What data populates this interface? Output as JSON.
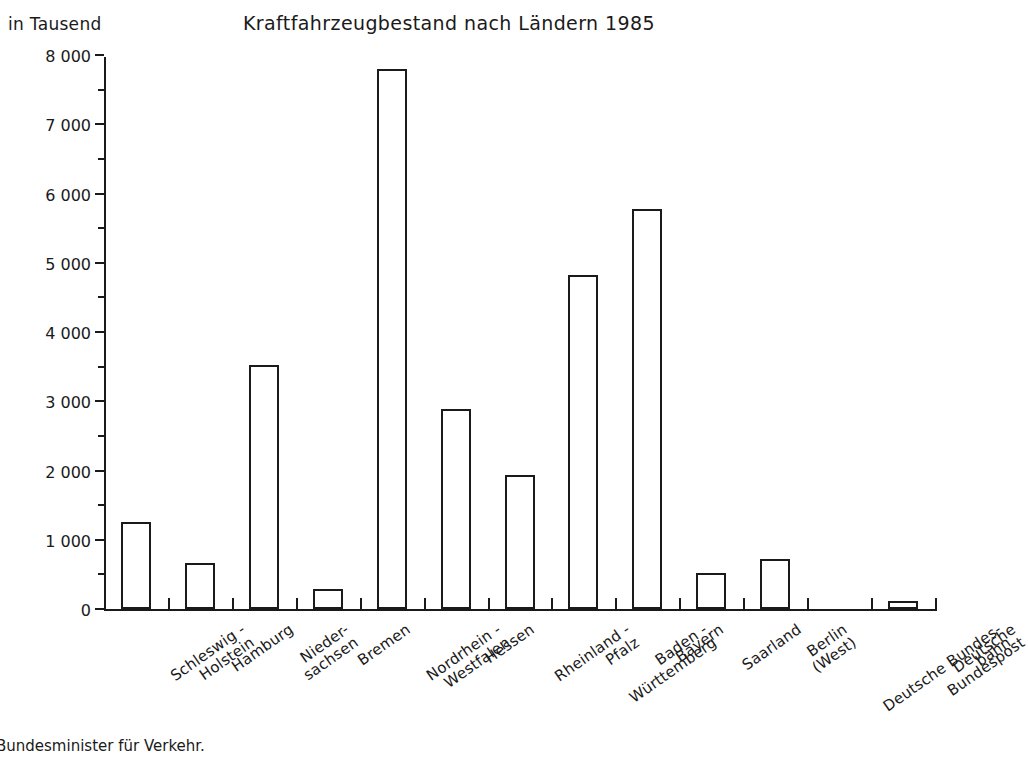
{
  "header": {
    "unit_label": "in Tausend",
    "title": "Kraftfahrzeugbestand nach Ländern 1985"
  },
  "footer": {
    "source_note": "Bundesminister für Verkehr."
  },
  "chart_data": {
    "type": "bar",
    "title": "Kraftfahrzeugbestand nach Ländern 1985",
    "xlabel": "",
    "ylabel": "in Tausend",
    "ylim": [
      0,
      8000
    ],
    "ytick_step": 1000,
    "yminor_step": 500,
    "grid": false,
    "legend": null,
    "bar_style": "outline",
    "categories": [
      "Schleswig -\nHolstein",
      "Hamburg",
      "Nieder-\nsachsen",
      "Bremen",
      "Nordrhein -\nWestfalen",
      "Hessen",
      "Rheinland -\nPfalz",
      "Baden -\nWürttemberg",
      "Bayern",
      "Saarland",
      "Berlin\n(West)",
      "Deutsche Bundes-\nbahn",
      "Deutsche\nBundespost"
    ],
    "values": [
      1250,
      660,
      3520,
      290,
      7800,
      2890,
      1930,
      4820,
      5780,
      520,
      720,
      0,
      110
    ],
    "ytick_labels": [
      "0",
      "1 000",
      "2 000",
      "3 000",
      "4 000",
      "5 000",
      "6 000",
      "7 000",
      "8 000"
    ],
    "ytick_values": [
      0,
      1000,
      2000,
      3000,
      4000,
      5000,
      6000,
      7000,
      8000
    ]
  }
}
